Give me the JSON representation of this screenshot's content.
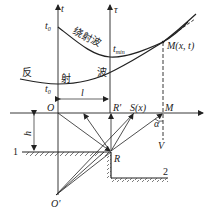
{
  "diagram": {
    "axes": {
      "t_axis_label": "t",
      "tau_axis_label": "τ",
      "t0_upper": "t",
      "t0_upper_sub": "0",
      "t0_lower": "t",
      "t0_lower_sub": "0",
      "tmin": "t",
      "tmin_sub": "min"
    },
    "curves": {
      "diffraction_wave_label": "绕射波",
      "reflection_wave_label_1": "反",
      "reflection_wave_label_2": "射",
      "reflection_wave_label_3": "波"
    },
    "points": {
      "M_xt": "M(x, t)",
      "O": "O",
      "R_prime": "R'",
      "S_x": "S(x)",
      "M": "M",
      "R": "R",
      "O_prime": "O'"
    },
    "dimensions": {
      "l": "l",
      "h": "h",
      "alpha": "α",
      "V": "V"
    },
    "layers": {
      "layer1": "1",
      "layer2": "2"
    },
    "colors": {
      "stroke": "#222222",
      "background": "#ffffff"
    }
  }
}
